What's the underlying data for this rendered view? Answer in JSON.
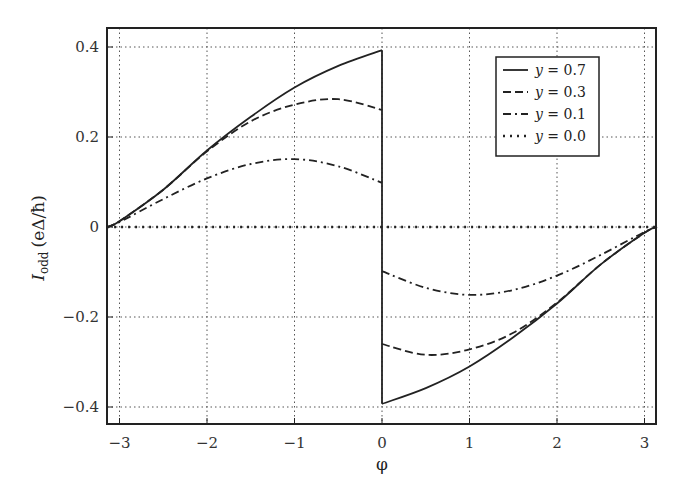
{
  "chart_data": {
    "type": "line",
    "title": "",
    "xlabel": "φ",
    "ylabel_main": "I",
    "ylabel_sub": "odd",
    "ylabel_units": "(eΔ/ħ)",
    "xlim": [
      -3.1416,
      3.1416
    ],
    "ylim": [
      -0.44,
      0.44
    ],
    "grid": true,
    "grid_style": "dotted",
    "legend_position": "upper right",
    "x_ticks": [
      -3,
      -2,
      -1,
      0,
      1,
      2,
      3
    ],
    "x_tick_labels": [
      "−3",
      "−2",
      "−1",
      "0",
      "1",
      "2",
      "3"
    ],
    "y_ticks": [
      -0.4,
      -0.2,
      0,
      0.2,
      0.4
    ],
    "y_tick_labels": [
      "−0.4",
      "−0.2",
      "0",
      "0.2",
      "0.4"
    ],
    "x": [
      -3.1416,
      -3.0,
      -2.5,
      -2.0,
      -1.5,
      -1.0,
      -0.5,
      -0.0001,
      0.0001,
      0.5,
      1.0,
      1.5,
      2.0,
      2.5,
      3.0,
      3.1416
    ],
    "series": [
      {
        "name": "y = 0.7",
        "style": "solid",
        "values": [
          0.0,
          0.013,
          0.083,
          0.17,
          0.245,
          0.31,
          0.358,
          0.393,
          -0.393,
          -0.358,
          -0.31,
          -0.245,
          -0.17,
          -0.083,
          -0.013,
          0.0
        ]
      },
      {
        "name": "y = 0.3",
        "style": "dashed",
        "values": [
          0.0,
          0.013,
          0.083,
          0.168,
          0.235,
          0.272,
          0.284,
          0.26,
          -0.26,
          -0.284,
          -0.272,
          -0.235,
          -0.168,
          -0.083,
          -0.013,
          0.0
        ]
      },
      {
        "name": "y = 0.1",
        "style": "dashdot",
        "values": [
          0.0,
          0.011,
          0.062,
          0.108,
          0.14,
          0.151,
          0.135,
          0.098,
          -0.098,
          -0.135,
          -0.151,
          -0.14,
          -0.108,
          -0.062,
          -0.011,
          0.0
        ]
      },
      {
        "name": "y = 0.0",
        "style": "dotted",
        "values": [
          0,
          0,
          0,
          0,
          0,
          0,
          0,
          0,
          0,
          0,
          0,
          0,
          0,
          0,
          0,
          0
        ]
      }
    ],
    "annotations": [
      "vertical jump at φ = 0 from +value to −value for each nonzero series"
    ]
  },
  "legend": {
    "items": [
      {
        "var": "y",
        "eq": " = 0.7",
        "style": "solid"
      },
      {
        "var": "y",
        "eq": " = 0.3",
        "style": "dashed"
      },
      {
        "var": "y",
        "eq": " = 0.1",
        "style": "dashdot"
      },
      {
        "var": "y",
        "eq": " = 0.0",
        "style": "dotted"
      }
    ]
  },
  "colors": {
    "line": "#222222",
    "grid": "#555555",
    "frame": "#222222"
  }
}
